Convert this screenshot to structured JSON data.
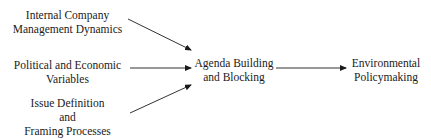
{
  "diagram": {
    "nodes": [
      {
        "id": "internal",
        "lines": [
          "Internal Company",
          "Management Dynamics"
        ]
      },
      {
        "id": "political",
        "lines": [
          "Political and Economic",
          "Variables"
        ]
      },
      {
        "id": "issue",
        "lines": [
          "Issue Definition",
          "and",
          "Framing Processes"
        ]
      },
      {
        "id": "agenda",
        "lines": [
          "Agenda Building",
          "and Blocking"
        ]
      },
      {
        "id": "policy",
        "lines": [
          "Environmental",
          "Policymaking"
        ]
      }
    ],
    "edges": [
      {
        "from": "internal",
        "to": "agenda"
      },
      {
        "from": "political",
        "to": "agenda"
      },
      {
        "from": "issue",
        "to": "agenda"
      },
      {
        "from": "agenda",
        "to": "policy"
      }
    ]
  }
}
